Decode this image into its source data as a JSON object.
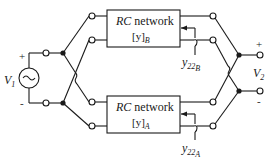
{
  "diagram": {
    "type": "circuit",
    "source": {
      "label": "V",
      "subscript": "1",
      "plus": "+",
      "minus": "-",
      "symbol": "~"
    },
    "output": {
      "label": "V",
      "subscript": "2",
      "plus": "+",
      "minus": "-"
    },
    "networks": [
      {
        "id": "B",
        "title_italic": "RC",
        "title": " network",
        "matrix_label": "[y]",
        "matrix_subscript": "B",
        "admittance_label": "y",
        "admittance_sub1": "22",
        "admittance_sub2": "B"
      },
      {
        "id": "A",
        "title_italic": "RC",
        "title": " network",
        "matrix_label": "[y]",
        "matrix_subscript": "A",
        "admittance_label": "y",
        "admittance_sub1": "22",
        "admittance_sub2": "A"
      }
    ]
  }
}
